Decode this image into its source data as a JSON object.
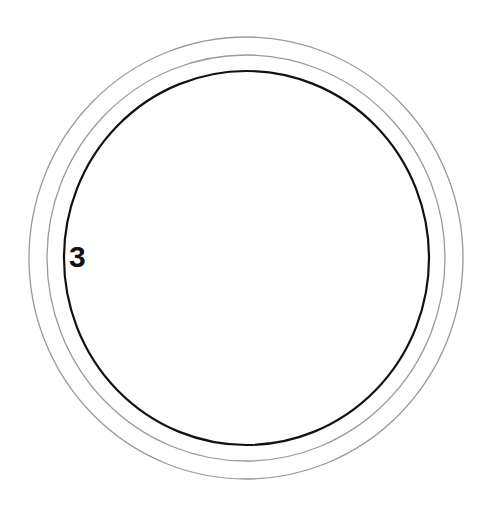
{
  "diagram": {
    "label": "3",
    "rings": [
      {
        "name": "outer-ring",
        "cx": 246,
        "cy": 258,
        "rx": 217,
        "ry": 221,
        "stroke": "#9a9a9a",
        "width": 1.3
      },
      {
        "name": "middle-ring",
        "cx": 246,
        "cy": 258,
        "rx": 199,
        "ry": 203,
        "stroke": "#9a9a9a",
        "width": 1.3
      },
      {
        "name": "inner-ring",
        "cx": 246.5,
        "cy": 258,
        "rx": 182.5,
        "ry": 187,
        "stroke": "#111111",
        "width": 2.2
      }
    ]
  }
}
